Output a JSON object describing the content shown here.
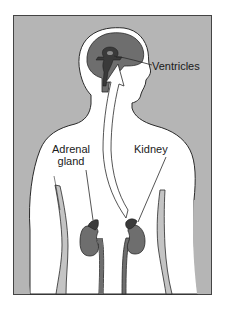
{
  "diagram": {
    "type": "anatomical-illustration",
    "colors": {
      "background": "#b5b5b5",
      "body": "#ffffff",
      "brain": "#6e6e6e",
      "ventricles": "#3a3a3a",
      "kidney": "#6e6e6e",
      "outline": "#2a2a2a",
      "limb_shade": "#c4c4c4"
    },
    "labels": {
      "ventricles": "Ventricles",
      "adrenal_line1": "Adrenal",
      "adrenal_line2": "gland",
      "kidney": "Kidney"
    }
  }
}
